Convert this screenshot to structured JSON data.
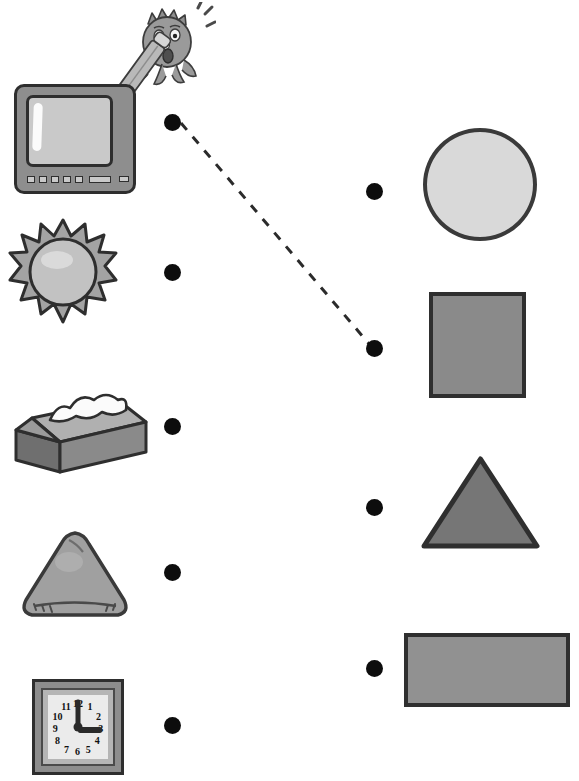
{
  "worksheet": {
    "title": "Match the objects to their shapes",
    "background_color": "#ffffff",
    "dot_color": "#0d0d0d",
    "line_style": "dashed",
    "line_color": "#2b2b2b"
  },
  "mascot": {
    "name": "pencil-character",
    "description": "cartoon head with spiky hair holding a pencil",
    "head_color": "#9a9a9a",
    "pencil_color": "#b9b9b9",
    "expression": "surprised"
  },
  "objects": [
    {
      "id": "television",
      "label": "television",
      "icon": "tv-icon",
      "dot": {
        "x": 164,
        "y": 114
      },
      "connected_to": "square"
    },
    {
      "id": "sun",
      "label": "sun",
      "icon": "sun-icon",
      "dot": {
        "x": 164,
        "y": 264
      },
      "connected_to": null
    },
    {
      "id": "tissue-box",
      "label": "tissue box",
      "icon": "tissue-box-icon",
      "dot": {
        "x": 164,
        "y": 418
      },
      "connected_to": null
    },
    {
      "id": "triangle-cushion",
      "label": "triangle cushion",
      "icon": "cushion-icon",
      "dot": {
        "x": 164,
        "y": 564
      },
      "connected_to": null
    },
    {
      "id": "clock",
      "label": "clock",
      "icon": "clock-icon",
      "time": "3:00",
      "numerals": [
        "12",
        "1",
        "2",
        "3",
        "4",
        "5",
        "6",
        "7",
        "8",
        "9",
        "10",
        "11"
      ],
      "dot": {
        "x": 164,
        "y": 717
      },
      "connected_to": null
    }
  ],
  "shapes": [
    {
      "id": "circle",
      "label": "circle",
      "fill": "#d9d9d9",
      "stroke": "#3a3a3a",
      "dot": {
        "x": 366,
        "y": 183
      }
    },
    {
      "id": "square",
      "label": "square",
      "fill": "#8a8a8a",
      "stroke": "#2f2f2f",
      "dot": {
        "x": 366,
        "y": 340
      }
    },
    {
      "id": "triangle",
      "label": "triangle",
      "fill": "#767676",
      "stroke": "#2f2f2f",
      "dot": {
        "x": 366,
        "y": 499
      }
    },
    {
      "id": "rectangle",
      "label": "rectangle",
      "fill": "#919191",
      "stroke": "#2f2f2f",
      "dot": {
        "x": 366,
        "y": 660
      }
    }
  ],
  "connection_line": {
    "from": {
      "x": 181,
      "y": 123
    },
    "to": {
      "x": 370,
      "y": 345
    },
    "dash_pattern": "9 9"
  }
}
